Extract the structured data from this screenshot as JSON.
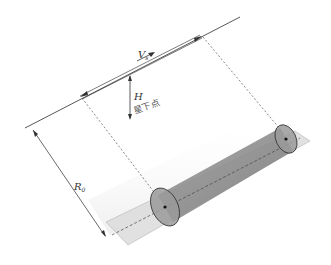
{
  "diagram": {
    "type": "side-looking radar / satellite imaging geometry",
    "labels": {
      "velocity": "V",
      "velocity_sub": "s",
      "height": "H",
      "nadir": "星下点",
      "range": "R",
      "range_sub": "0"
    },
    "colors": {
      "line": "#444444",
      "dashed": "#555555",
      "strip": "#d9d9d9",
      "beam": "#8a8a8a",
      "ellipse_fill": "#9a9a9a",
      "ellipse_stroke": "#333333",
      "shadow": "#f0f0f0"
    }
  }
}
